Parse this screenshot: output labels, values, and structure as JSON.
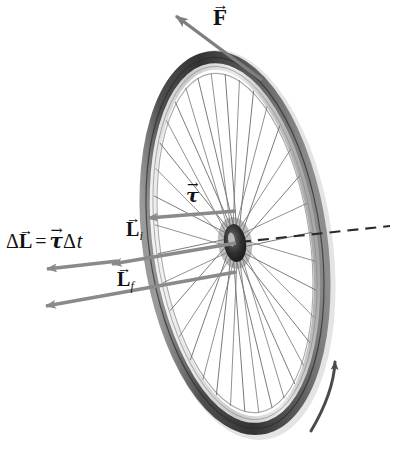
{
  "figure": {
    "background_color": "#ffffff",
    "width": 393,
    "height": 457
  },
  "labels": {
    "force": {
      "name": "force-vector-label",
      "symbol": "F",
      "arrow_accent": "→",
      "description": "Applied force vector"
    },
    "torque": {
      "name": "torque-vector-label",
      "symbol": "τ",
      "arrow_accent": "→",
      "description": "Torque vector"
    },
    "angular_momentum_initial": {
      "name": "initial-angular-momentum-label",
      "symbol": "L",
      "subscript": "i",
      "arrow_accent": "→",
      "description": "Initial angular momentum"
    },
    "angular_momentum_final": {
      "name": "final-angular-momentum-label",
      "symbol": "L",
      "subscript": "f",
      "arrow_accent": "→",
      "description": "Final angular momentum"
    },
    "delta_L_equation": {
      "name": "delta-angular-momentum-equation",
      "delta": "Δ",
      "symbol": "L",
      "arrow_accent": "→",
      "equals": "=",
      "tau": "τ",
      "delta2": "Δ",
      "time": "t",
      "plain_text": "ΔL⃗ = τ⃗Δt",
      "description": "Change in angular momentum equals torque times time interval"
    }
  },
  "graphics": {
    "wheel": {
      "name": "bicycle-wheel",
      "center_x": 235,
      "center_y": 243,
      "rx": 88,
      "ry": 190,
      "rotation_deg": -8,
      "spoke_count": 36,
      "tire_color": "#5d5d5d",
      "tire_dark": "#3a3a3a",
      "rim_color": "#cfcfcf",
      "spoke_color": "#6e6e6e",
      "hub_color": "#2b2b2b"
    },
    "axis_line": {
      "name": "rotation-axis-dashed-line",
      "style": "dashed",
      "color": "#2b2b2b",
      "from_x": 235,
      "from_y": 243,
      "to_x": 390,
      "to_y": 226
    },
    "vectors": [
      {
        "name": "force-arrow",
        "color": "#7f7f7f",
        "from_x": 262,
        "from_y": 78,
        "to_x": 170,
        "to_y": 10
      },
      {
        "name": "torque-arrow",
        "color": "#8a8a8a",
        "from_x": 235,
        "from_y": 212,
        "to_x": 141,
        "to_y": 219
      },
      {
        "name": "initial-angular-momentum-arrow",
        "color": "#8a8a8a",
        "from_x": 235,
        "from_y": 243,
        "to_x": 104,
        "to_y": 265
      },
      {
        "name": "final-angular-momentum-arrow",
        "color": "#8a8a8a",
        "from_x": 235,
        "from_y": 272,
        "to_x": 37,
        "to_y": 308
      },
      {
        "name": "delta-angular-momentum-arrow",
        "color": "#8a8a8a",
        "from_x": 120,
        "from_y": 262,
        "to_x": 40,
        "to_y": 270
      }
    ],
    "spin_arrow": {
      "name": "rotation-direction-arrow",
      "color": "#4a4a4a",
      "description": "Curved arrow along lower right rim indicating spin direction"
    }
  }
}
